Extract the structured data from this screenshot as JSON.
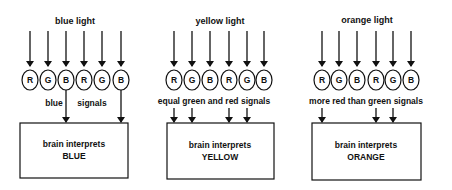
{
  "panels": [
    {
      "title": "blue light",
      "receptors": [
        "R",
        "G",
        "B",
        "R",
        "G",
        "B"
      ],
      "signal_label_parts": [
        "blue",
        "signals"
      ],
      "signals_from": [
        2,
        5
      ],
      "box_line1": "brain interprets",
      "box_line2": "BLUE"
    },
    {
      "title": "yellow light",
      "receptors": [
        "R",
        "G",
        "B",
        "R",
        "G",
        "B"
      ],
      "signal_label": "equal green and red signals",
      "signals_from": [
        0,
        1,
        3,
        4
      ],
      "box_line1": "brain interprets",
      "box_line2": "YELLOW"
    },
    {
      "title": "orange light",
      "receptors": [
        "R",
        "G",
        "B",
        "R",
        "G",
        "B"
      ],
      "signal_label": "more red than green signals",
      "signals_from": [
        0,
        3,
        4
      ],
      "box_line1": "brain interprets",
      "box_line2": "ORANGE"
    }
  ]
}
